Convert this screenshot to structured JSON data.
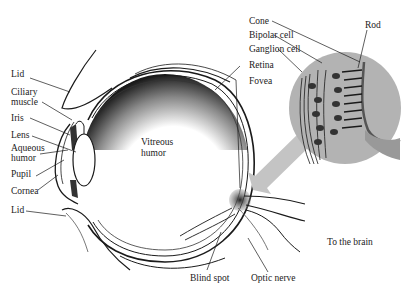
{
  "figure": {
    "colors": {
      "background": "#ffffff",
      "ink": "#1a1a1a",
      "magnifier_fill": "#b3b3b3",
      "arrow_fill": "#c4c4c4",
      "vitreous_shade": "#222222"
    }
  },
  "labels": {
    "left": [
      {
        "id": "lid-top",
        "text": "Lid"
      },
      {
        "id": "ciliary-muscle",
        "text": "Ciliary muscle",
        "lines": [
          "Ciliary",
          "muscle"
        ]
      },
      {
        "id": "iris",
        "text": "Iris"
      },
      {
        "id": "lens",
        "text": "Lens"
      },
      {
        "id": "aqueous-humor",
        "text": "Aqueous humor",
        "lines": [
          "Aqueous",
          "humor"
        ]
      },
      {
        "id": "pupil",
        "text": "Pupil"
      },
      {
        "id": "cornea",
        "text": "Cornea"
      },
      {
        "id": "lid-bottom",
        "text": "Lid"
      }
    ],
    "center": {
      "vitreous_humor": {
        "lines": [
          "Vitreous",
          "humor"
        ]
      }
    },
    "top_right": [
      {
        "id": "cone",
        "text": "Cone"
      },
      {
        "id": "bipolar-cell",
        "text": "Bipolar cell"
      },
      {
        "id": "ganglion-cell",
        "text": "Ganglion cell"
      },
      {
        "id": "retina",
        "text": "Retina"
      },
      {
        "id": "fovea",
        "text": "Fovea"
      },
      {
        "id": "rod",
        "text": "Rod"
      }
    ],
    "bottom": [
      {
        "id": "blind-spot",
        "text": "Blind spot"
      },
      {
        "id": "optic-nerve",
        "text": "Optic nerve"
      },
      {
        "id": "to-the-brain",
        "text": "To the brain"
      }
    ]
  }
}
